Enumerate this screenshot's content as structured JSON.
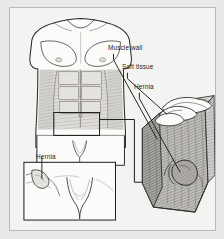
{
  "figure": {
    "style": "grayscale medical line drawing",
    "background_color": "#e9e9e9",
    "plate_color": "#f3f3f1",
    "border_color": "#b9b9b9",
    "ink_color": "#1b1b1b"
  },
  "labels": {
    "muscle_wall": "Muscle wall",
    "soft_tissue": "Soft tissue",
    "hernia_cutaway": "Hernia",
    "hernia_inset": "Hernia"
  },
  "panels": {
    "torso": {
      "name": "male torso anterior view",
      "description": "Front view of a male torso showing shaded abdominal muscle wall and a rectangular callout box over the lower right abdomen and groin."
    },
    "groin_inset": {
      "name": "groin detail inset",
      "description": "Bordered close-up box of the groin showing a hernia bulge at the left inguinal region."
    },
    "cutaway": {
      "name": "muscle wall cutaway block",
      "description": "Three-dimensional cutaway of the abdominal wall with hatched muscle layers, white intestinal loops above, and a hernia sac bulging through the muscle wall."
    }
  }
}
